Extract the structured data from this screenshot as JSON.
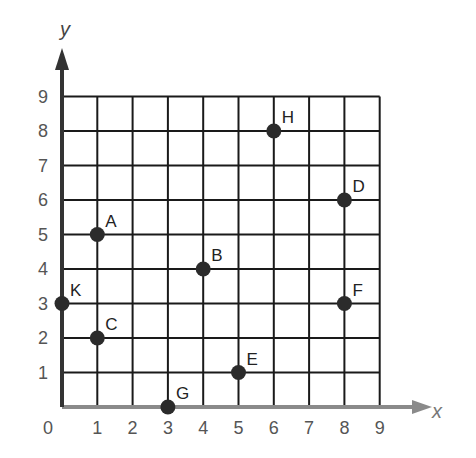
{
  "chart_data": {
    "type": "scatter",
    "title": "",
    "xlabel": "x",
    "ylabel": "y",
    "xlim": [
      0,
      9
    ],
    "ylim": [
      0,
      9
    ],
    "grid": true,
    "x_ticks": [
      "0",
      "1",
      "2",
      "3",
      "4",
      "5",
      "6",
      "7",
      "8",
      "9"
    ],
    "y_ticks": [
      "1",
      "2",
      "3",
      "4",
      "5",
      "6",
      "7",
      "8",
      "9"
    ],
    "points": [
      {
        "label": "A",
        "x": 1,
        "y": 5
      },
      {
        "label": "B",
        "x": 4,
        "y": 4
      },
      {
        "label": "C",
        "x": 1,
        "y": 2
      },
      {
        "label": "D",
        "x": 8,
        "y": 6
      },
      {
        "label": "E",
        "x": 5,
        "y": 1
      },
      {
        "label": "F",
        "x": 8,
        "y": 3
      },
      {
        "label": "G",
        "x": 3,
        "y": 0
      },
      {
        "label": "H",
        "x": 6,
        "y": 8
      },
      {
        "label": "K",
        "x": 0,
        "y": 3
      }
    ]
  },
  "colors": {
    "grid": "#1a1a1a",
    "axis": "#8a8a8a",
    "y_axis": "#333333",
    "point": "#2b2b2b",
    "tick_text": "#555555"
  }
}
